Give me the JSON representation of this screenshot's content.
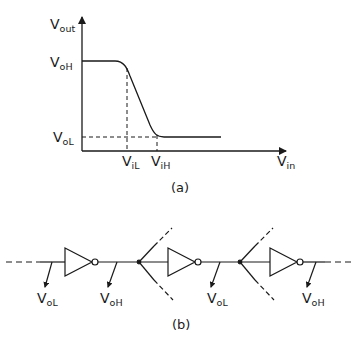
{
  "figure_a": {
    "caption": "(a)",
    "y_axis": {
      "main": "V",
      "sub": "out"
    },
    "x_axis": {
      "main": "V",
      "sub": "in"
    },
    "levels": {
      "voh": {
        "main": "V",
        "sub": "oH"
      },
      "vol": {
        "main": "V",
        "sub": "oL"
      }
    },
    "thresholds": {
      "vil": {
        "main": "V",
        "sub": "iL"
      },
      "vih": {
        "main": "V",
        "sub": "iH"
      }
    }
  },
  "figure_b": {
    "caption": "(b)",
    "node_labels": [
      {
        "main": "V",
        "sub": "oL"
      },
      {
        "main": "V",
        "sub": "oH"
      },
      {
        "main": "V",
        "sub": "oL"
      },
      {
        "main": "V",
        "sub": "oH"
      }
    ]
  },
  "colors": {
    "stroke": "#1a1a1a",
    "background": "#ffffff"
  }
}
